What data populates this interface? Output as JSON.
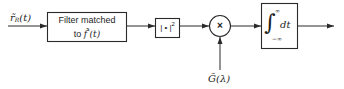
{
  "diagram": {
    "type": "signal-processing block diagram",
    "input": {
      "label_main": "r̃",
      "label_sub": "R",
      "label_arg": "(t)"
    },
    "blocks": [
      {
        "id": "matched-filter",
        "line1": "Filter matched",
        "line2_prefix": "to ",
        "line2_sym": "f̃",
        "line2_sup": "*",
        "line2_arg": "(t)"
      },
      {
        "id": "magnitude-squared",
        "text": "| • |",
        "sup": "2"
      },
      {
        "id": "multiplier",
        "symbol": "×"
      },
      {
        "id": "integrator",
        "integral": "∫",
        "upper_limit": "∞",
        "lower_limit": "−∞",
        "differential": "dt"
      }
    ],
    "side_input": {
      "label": "G̃(λ)"
    },
    "colors": {
      "line": "#2a2a2a",
      "text": "#1e1e1e",
      "background": "#ffffff"
    }
  }
}
